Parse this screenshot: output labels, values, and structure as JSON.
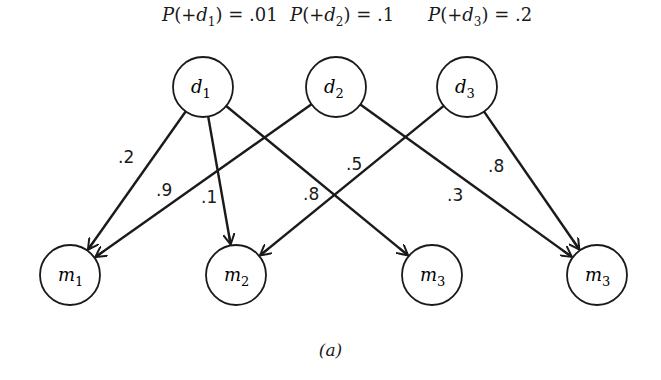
{
  "priors": [
    {
      "id": "d1",
      "prefix": "P(+",
      "var": "d",
      "sub": "1",
      "suffix": ") = .01",
      "x": 162
    },
    {
      "id": "d2",
      "prefix": "P(+",
      "var": "d",
      "sub": "2",
      "suffix": ") = .1",
      "x": 290
    },
    {
      "id": "d3",
      "prefix": "P(+",
      "var": "d",
      "sub": "3",
      "suffix": ") = .2",
      "x": 428
    }
  ],
  "nodes": {
    "top": [
      {
        "id": "d1",
        "var": "d",
        "sub": "1",
        "cx": 203,
        "cy": 87
      },
      {
        "id": "d2",
        "var": "d",
        "sub": "2",
        "cx": 336,
        "cy": 87
      },
      {
        "id": "d3",
        "var": "d",
        "sub": "3",
        "cx": 467,
        "cy": 87
      }
    ],
    "bottom": [
      {
        "id": "m1",
        "var": "m",
        "sub": "1",
        "cx": 70,
        "cy": 275
      },
      {
        "id": "m2",
        "var": "m",
        "sub": "2",
        "cx": 236,
        "cy": 275
      },
      {
        "id": "m3a",
        "var": "m",
        "sub": "3",
        "cx": 432,
        "cy": 275
      },
      {
        "id": "m3b",
        "var": "m",
        "sub": "3",
        "cx": 597,
        "cy": 275
      }
    ]
  },
  "edges": [
    {
      "from": "d1",
      "to": "m1",
      "label": ".2",
      "lx": 118,
      "ly": 163
    },
    {
      "from": "d1",
      "to": "m2",
      "label": ".1",
      "lx": 201,
      "ly": 203
    },
    {
      "from": "d1",
      "to": "m3a",
      "label": ".8",
      "lx": 303,
      "ly": 200
    },
    {
      "from": "d2",
      "to": "m1",
      "label": ".9",
      "lx": 156,
      "ly": 196
    },
    {
      "from": "d2",
      "to": "m3b",
      "label": ".3",
      "lx": 447,
      "ly": 201
    },
    {
      "from": "d3",
      "to": "m2",
      "label": ".5",
      "lx": 346,
      "ly": 170
    },
    {
      "from": "d3",
      "to": "m3b",
      "label": ".8",
      "lx": 488,
      "ly": 172
    }
  ],
  "node_radius": 30,
  "caption": "(a)",
  "colors": {
    "stroke": "#1a1a1a",
    "background": "#ffffff"
  }
}
